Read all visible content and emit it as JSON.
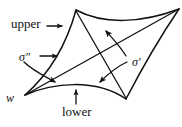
{
  "figure": {
    "type": "diagram",
    "background_color": "#ffffff",
    "stroke_color": "#111111",
    "labels": {
      "upper": "upper",
      "lower": "lower",
      "sigma_prime": "σ′",
      "sigma_double_prime": "σ″",
      "w": "w"
    },
    "annotations": [
      {
        "name": "upper",
        "text": "upper",
        "arrow": "right",
        "points_to": "upper-left boundary arc"
      },
      {
        "name": "lower",
        "text": "lower",
        "arrow": "up",
        "points_to": "lower boundary arc"
      },
      {
        "name": "sigma-double-prime",
        "text": "σ″",
        "arrow": "right",
        "points_to": "left boundary arc"
      },
      {
        "name": "sigma-double-prime-curved",
        "text": "σ″",
        "arrow": "curved-down-right",
        "points_to": "interior diagonal near w"
      },
      {
        "name": "sigma-prime",
        "text": "σ′",
        "arrow": "curved-up-left",
        "points_to": "upper-right boundary arc"
      },
      {
        "name": "sigma-prime-curved",
        "text": "σ′",
        "arrow": "curved-down-left",
        "points_to": "lower-right interior diagonal"
      },
      {
        "name": "w",
        "text": "w",
        "arrow": "none",
        "points_to": "left cusp vertex"
      }
    ],
    "cusps": [
      {
        "name": "top-cusp",
        "x": 76,
        "y": 10
      },
      {
        "name": "right-cusp",
        "x": 179,
        "y": 9
      },
      {
        "name": "bottom-right-cusp",
        "x": 126,
        "y": 99
      },
      {
        "name": "left-cusp-w",
        "x": 25,
        "y": 95
      }
    ]
  }
}
